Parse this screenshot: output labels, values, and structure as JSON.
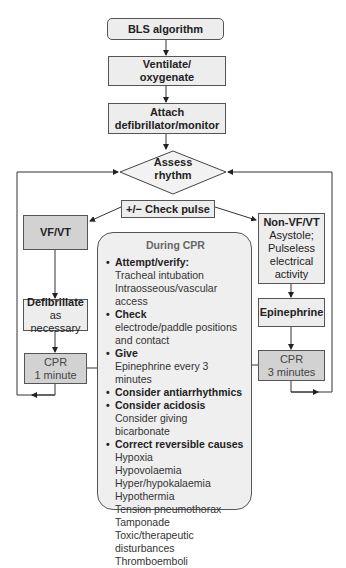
{
  "nodes": {
    "bls": "BLS algorithm",
    "ventilate": [
      "Ventilate/",
      "oxygenate"
    ],
    "attach": [
      "Attach",
      "defibrillator/monitor"
    ],
    "assess": [
      "Assess",
      "rhythm"
    ],
    "check_pulse": "+/− Check pulse",
    "vfvt": "VF/VT",
    "defibrillate": {
      "head": "Defibrillate",
      "sub": "as necessary"
    },
    "cpr_left": [
      "CPR",
      "1 minute"
    ],
    "nonvf": {
      "head": "Non-VF/VT",
      "sub": [
        "Asystole;",
        "Pulseless",
        "electrical",
        "activity"
      ]
    },
    "epinephrine": "Epinephrine",
    "cpr_right": [
      "CPR",
      "3 minutes"
    ]
  },
  "during_cpr": {
    "title": "During CPR",
    "items": [
      {
        "head": "Attempt/verify:",
        "sub": [
          "Tracheal intubation",
          "Intraosseous/vascular access"
        ]
      },
      {
        "head": "Check",
        "sub": [
          "electrode/paddle positions",
          "and contact"
        ]
      },
      {
        "head": "Give",
        "sub": [
          "Epinephrine every 3 minutes"
        ]
      },
      {
        "head": "Consider antiarrhythmics",
        "sub": []
      },
      {
        "head": "Consider acidosis",
        "sub": [
          "Consider giving bicarbonate"
        ]
      },
      {
        "head": "Correct reversible causes",
        "sub": [
          "Hypoxia",
          "Hypovolaemia",
          "Hyper/hypokalaemia",
          "Hypothermia",
          "Tension pneumothorax",
          "Tamponade",
          "Toxic/therapeutic disturbances",
          "Thromboemboli"
        ]
      }
    ]
  }
}
